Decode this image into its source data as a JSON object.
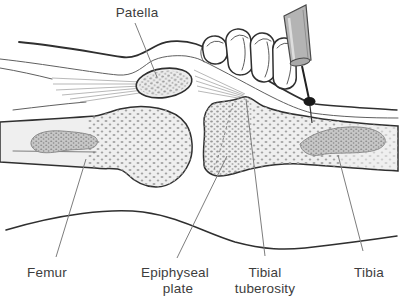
{
  "figure": {
    "kind": "medical line illustration",
    "elements": [
      "skin-outline",
      "quadriceps-tendon",
      "patellar-ligament",
      "patella",
      "femur",
      "tibia",
      "epiphyseal-plate",
      "bone-marrow-regions",
      "stabilizing-hand",
      "syringe-needle",
      "insertion-site-dot"
    ],
    "labels": {
      "patella": "Patella",
      "femur": "Femur",
      "epiphyseal_plate": [
        "Epiphyseal",
        "plate"
      ],
      "tibial_tuberosity": [
        "Tibial",
        "tuberosity"
      ],
      "tibia": "Tibia"
    },
    "colors": {
      "background": "#ffffff",
      "line": "#2f2f2f",
      "leader_line": "#7d7d7d",
      "label_text": "#3d3d3d",
      "bone_fill": "#efefef",
      "stipple": "#a0a0a0",
      "marrow_fill": "#c7c7c7",
      "syringe_barrel": "#b4b4b4",
      "insertion_dot": "#1a1a1a"
    }
  }
}
